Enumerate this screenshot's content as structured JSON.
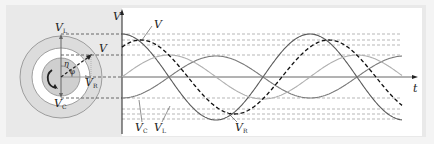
{
  "diagram": {
    "type": "rlc-phasor-and-waveforms",
    "phasor": {
      "labels": {
        "VL": {
          "main": "V",
          "sub": "L"
        },
        "V": {
          "main": "V",
          "sub": ""
        },
        "VR": {
          "main": "V",
          "sub": "R"
        },
        "VC": {
          "main": "V",
          "sub": "C"
        },
        "eta": "η",
        "phi": "φ"
      },
      "rotation": "counterclockwise"
    },
    "waveforms": {
      "y_axis_label": "V",
      "x_axis_label": "t",
      "curve_labels": {
        "V": {
          "main": "V",
          "sub": ""
        },
        "VC": {
          "main": "V",
          "sub": "C"
        },
        "VL": {
          "main": "V",
          "sub": "L"
        },
        "VR": {
          "main": "V",
          "sub": "R"
        }
      }
    },
    "colors": {
      "frame_bg": "#e9e9e9",
      "plot_bg": "#ffffff",
      "VL": "#555555",
      "VC": "#777777",
      "VR": "#aaaaaa",
      "V": "#222222",
      "dashed_guides": "#666666"
    }
  }
}
